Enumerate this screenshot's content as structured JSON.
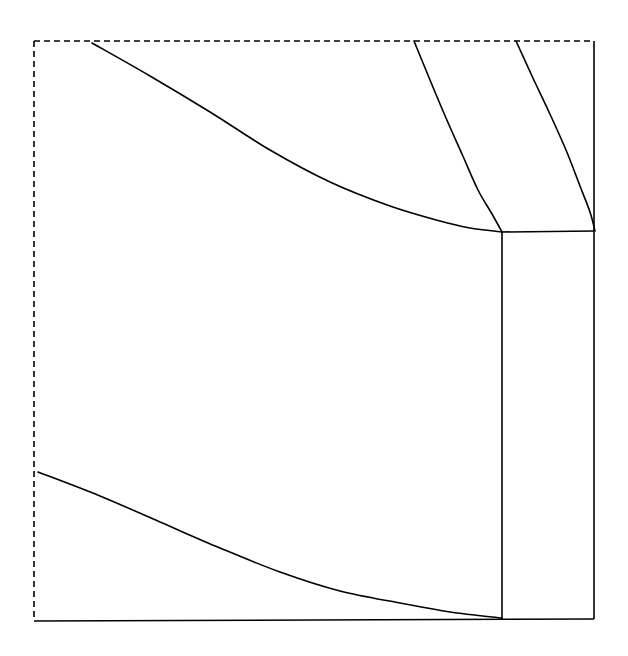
{
  "figure": {
    "title": "",
    "canvas": {
      "width": 628,
      "height": 656,
      "background": "#ffffff"
    },
    "stroke": {
      "color": "#000000",
      "width": 1.6,
      "dash_pattern": "6,4"
    }
  },
  "chart_data": {
    "type": "line",
    "title": "",
    "subtitle": "",
    "xlabel": "",
    "ylabel": "",
    "xlim": [
      0,
      628
    ],
    "ylim": [
      0,
      656
    ],
    "grid": false,
    "legend": null,
    "tick_labels": {
      "x": [],
      "y": []
    },
    "annotations": [],
    "frame": {
      "left_dashed_x": 34,
      "top_dashed_y": 41,
      "right_solid_x": 594,
      "bottom_solid_y": 619,
      "corner_x": 502,
      "corner_y": 232
    },
    "series": [
      {
        "name": "top-dashed-boundary",
        "style": "dashed",
        "points": [
          [
            34,
            41
          ],
          [
            594,
            41
          ]
        ]
      },
      {
        "name": "left-dashed-boundary",
        "style": "dashed",
        "points": [
          [
            34,
            41
          ],
          [
            34,
            619
          ]
        ]
      },
      {
        "name": "right-vertical-edge",
        "style": "solid",
        "points": [
          [
            594,
            41
          ],
          [
            594,
            619
          ]
        ]
      },
      {
        "name": "bottom-horizontal-edge",
        "style": "solid",
        "points": [
          [
            34,
            621
          ],
          [
            594,
            619
          ]
        ]
      },
      {
        "name": "upper-arc",
        "style": "solid",
        "points": [
          [
            92,
            43
          ],
          [
            150,
            76
          ],
          [
            210,
            112
          ],
          [
            270,
            150
          ],
          [
            330,
            182
          ],
          [
            390,
            206
          ],
          [
            440,
            221
          ],
          [
            470,
            228
          ],
          [
            502,
            232
          ]
        ]
      },
      {
        "name": "lower-arc",
        "style": "solid",
        "points": [
          [
            38,
            472
          ],
          [
            100,
            496
          ],
          [
            160,
            522
          ],
          [
            220,
            548
          ],
          [
            280,
            572
          ],
          [
            340,
            591
          ],
          [
            400,
            603
          ],
          [
            450,
            612
          ],
          [
            502,
            618
          ]
        ]
      },
      {
        "name": "radial-curve-inner",
        "style": "solid",
        "points": [
          [
            414,
            41
          ],
          [
            430,
            80
          ],
          [
            446,
            118
          ],
          [
            462,
            154
          ],
          [
            478,
            190
          ],
          [
            492,
            214
          ],
          [
            502,
            232
          ]
        ]
      },
      {
        "name": "radial-curve-outer",
        "style": "solid",
        "points": [
          [
            516,
            41
          ],
          [
            532,
            76
          ],
          [
            549,
            112
          ],
          [
            566,
            150
          ],
          [
            580,
            186
          ],
          [
            590,
            212
          ],
          [
            595,
            231
          ]
        ]
      },
      {
        "name": "inner-vertical-divider",
        "style": "solid",
        "points": [
          [
            502,
            232
          ],
          [
            502,
            619
          ]
        ]
      },
      {
        "name": "panel-top-horizontal",
        "style": "solid",
        "points": [
          [
            502,
            232
          ],
          [
            594,
            231
          ]
        ]
      }
    ]
  }
}
